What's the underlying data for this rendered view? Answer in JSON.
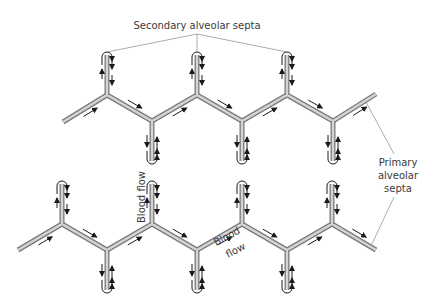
{
  "labels": {
    "secondary": "Secondary alveolar septa",
    "primary_line1": "Primary",
    "primary_line2": "alveolar",
    "primary_line3": "septa",
    "blood_flow_1": "Blood flow",
    "blood_flow_2a": "Blood",
    "blood_flow_2b": "flow"
  },
  "colors": {
    "septum_outer": "#7a7a7a",
    "septum_inner": "#d4d4d4",
    "arrow": "#1a1a1a",
    "leader": "#8a8a8a"
  },
  "rows": [
    {
      "name": "upper-primary-septum",
      "start_direction": "up"
    },
    {
      "name": "lower-primary-septum",
      "start_direction": "up"
    }
  ]
}
